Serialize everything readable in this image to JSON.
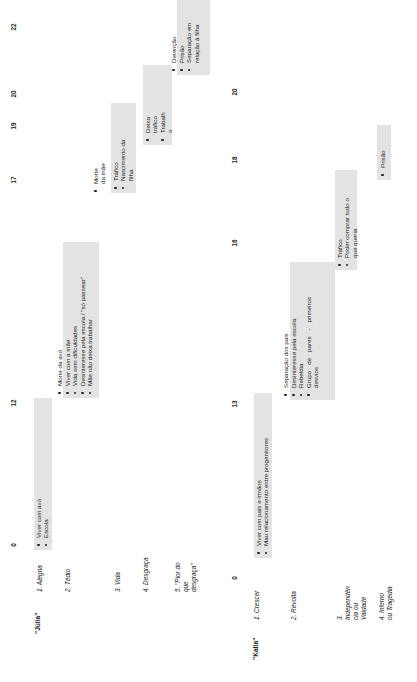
{
  "timelines": [
    {
      "name": "\"Júlia\"",
      "ticks": [
        "0",
        "12",
        "17",
        "19",
        "20",
        "22"
      ],
      "stages": [
        {
          "label": "1. Alegria",
          "items": [
            "Viver com avó",
            "Escola"
          ]
        },
        {
          "label": "2. Tédio",
          "items": [
            "Morte da avó",
            "Viver com a mãe",
            "Vida sem dificuldades",
            "Desinteresse pela escola / \"só passear\"",
            "Mãe não deixa trabalhar"
          ]
        },
        {
          "label": "3. Vida",
          "items": [
            "Morte da mãe",
            "Tráfico",
            "Nascimento da filha"
          ]
        },
        {
          "label": "4. Desgraça",
          "items": [
            "Deixa tráfico",
            "Trabalho"
          ]
        },
        {
          "label": "5. \"Pior do que desgraça\"",
          "items": [
            "Detenção",
            "Prisão",
            "Separação em relação à filha"
          ]
        }
      ]
    },
    {
      "name": "\"Katia\"",
      "ticks": [
        "0",
        "13",
        "16",
        "18",
        "20"
      ],
      "stages": [
        {
          "label": "1. Crescer",
          "items": [
            "Viver com pais e irmãos",
            "Mau relacionamento entre progenitores"
          ]
        },
        {
          "label": "2. Revolta",
          "items": [
            "Separação dos pais",
            "Desinteresse pela escola",
            "Rebeldia",
            "Grupo de pares - primeiros desvios"
          ]
        },
        {
          "label": "3. Independência ou Vaidade",
          "items": [
            "Tráfico",
            "Poder comprar tudo o que queria"
          ]
        },
        {
          "label": "4. Inferno ou Tragédia",
          "items": [
            "Prisão"
          ]
        }
      ]
    }
  ],
  "display": {
    "julia_stage5_label": "5. \"Pior do que desgraça\"",
    "julia_vida_line1": "Morte",
    "julia_vida_line2": "da mãe",
    "julia_desgraca_item1a": "Deixa",
    "julia_desgraca_item1b": "tráfico",
    "julia_desgraca_item2a": "Trabalh",
    "julia_desgraca_item2b": "o",
    "katia_stage3_label": "3. Independên cia ou Vaidade",
    "katia_stage4_label": "4. Inferno ou Tragédia"
  },
  "colors": {
    "box_fill": "#e3e3e3",
    "text": "#222222"
  }
}
